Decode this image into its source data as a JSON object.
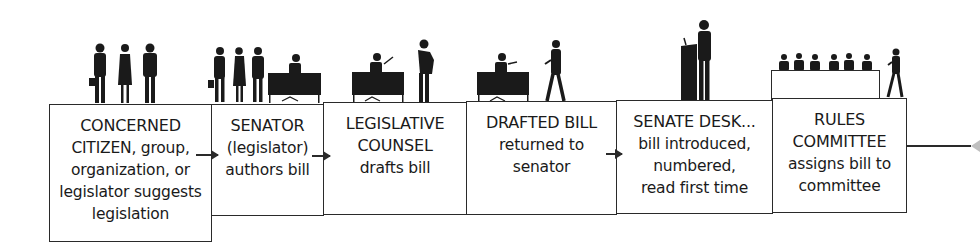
{
  "diagram": {
    "type": "process-flow",
    "title": "",
    "steps": [
      {
        "id": "concerned-citizen",
        "lines": [
          "CONCERNED",
          "CITIZEN, group,",
          "organization, or",
          "legislator suggests",
          "legislation"
        ],
        "illustration": "three-people-standing-icon"
      },
      {
        "id": "senator",
        "lines": [
          "SENATOR",
          "(legislator)",
          "authors bill"
        ],
        "illustration": "people-and-seated-senator-icon"
      },
      {
        "id": "legislative-counsel",
        "lines": [
          "LEGISLATIVE",
          "COUNSEL",
          "drafts bill"
        ],
        "illustration": "desk-and-standing-person-icon"
      },
      {
        "id": "drafted-bill",
        "lines": [
          "DRAFTED BILL",
          "returned to",
          "senator"
        ],
        "illustration": "desk-and-walking-person-icon"
      },
      {
        "id": "senate-desk",
        "lines": [
          "SENATE DESK...",
          "bill introduced,",
          "numbered,",
          "read first time"
        ],
        "illustration": "speaker-at-podium-icon"
      },
      {
        "id": "rules-committee",
        "lines": [
          "RULES",
          "COMMITTEE",
          "assigns bill to",
          "committee"
        ],
        "illustration": "committee-panel-icon"
      }
    ],
    "connections": [
      {
        "from": "concerned-citizen",
        "to": "senator",
        "style": "arrow"
      },
      {
        "from": "senator",
        "to": "legislative-counsel",
        "style": "arrow"
      },
      {
        "from": "drafted-bill",
        "to": "senate-desk",
        "style": "arrow"
      },
      {
        "from": "rules-committee",
        "to": "next-step",
        "style": "line-continues-right"
      }
    ],
    "colors": {
      "stroke": "#2a2a2a",
      "fill": "#ffffff",
      "silhouette": "#1a1a1a",
      "faded_arrowhead": "#bfbfbf"
    }
  }
}
